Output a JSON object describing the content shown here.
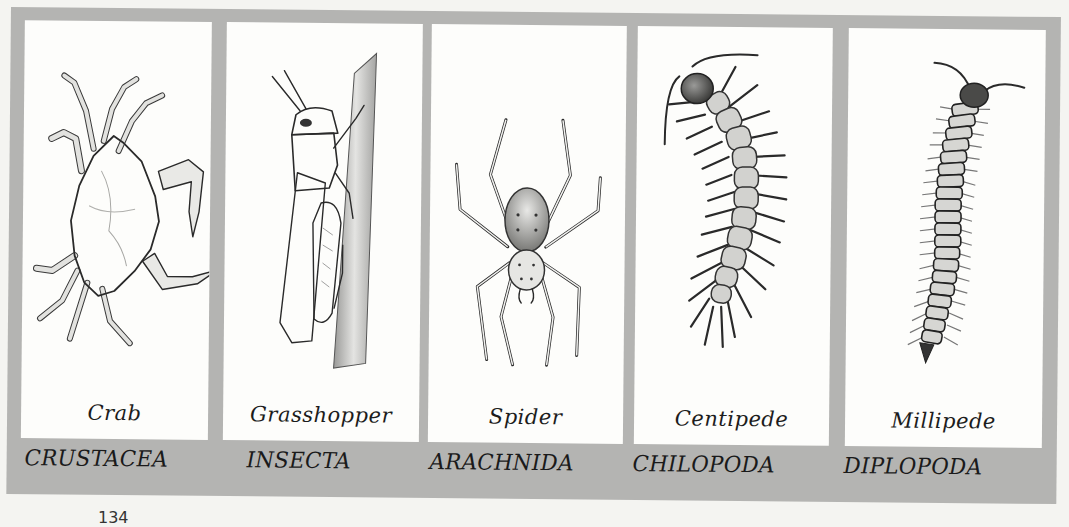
{
  "figure": {
    "panels": [
      {
        "id": "crab",
        "common_name": "Crab",
        "class_name": "CRUSTACEA",
        "illustration": "crab-illustration"
      },
      {
        "id": "grasshopper",
        "common_name": "Grasshopper",
        "class_name": "INSECTA",
        "illustration": "grasshopper-illustration"
      },
      {
        "id": "spider",
        "common_name": "Spider",
        "class_name": "ARACHNIDA",
        "illustration": "spider-illustration"
      },
      {
        "id": "centipede",
        "common_name": "Centipede",
        "class_name": "CHILOPODA",
        "illustration": "centipede-illustration"
      },
      {
        "id": "millipede",
        "common_name": "Millipede",
        "class_name": "DIPLOPODA",
        "illustration": "millipede-illustration"
      }
    ],
    "colors": {
      "frame": "#b4b4b2",
      "panel": "#fdfdfb",
      "page": "#f4f4f1",
      "ink": "#1c1c1c"
    }
  },
  "page": {
    "number_partial": "134"
  }
}
